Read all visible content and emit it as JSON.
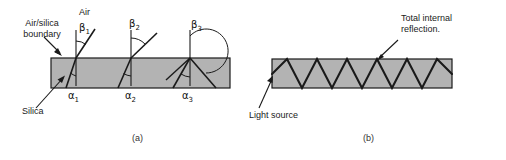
{
  "figure": {
    "title_a": "(a)",
    "title_b": "(b)",
    "bar_fill": "#b3b3b3",
    "bar_stroke": "#1a1a1a",
    "ray_color": "#1a1a1a",
    "text_color": "#1a1a1a"
  },
  "panel_a": {
    "labels": {
      "air": "Air",
      "air_silica_boundary_line1": "Air/silica",
      "air_silica_boundary_line2": "boundary",
      "silica": "Silica",
      "beta1": "β",
      "beta1_sub": "1",
      "beta2": "β",
      "beta2_sub": "2",
      "beta3": "β",
      "beta3_sub": "3",
      "alpha1": "α",
      "alpha1_sub": "1",
      "alpha2": "α",
      "alpha2_sub": "2",
      "alpha3": "α",
      "alpha3_sub": "3"
    },
    "caption": "(a)",
    "slab": {
      "x": 51,
      "y": 58,
      "width": 179,
      "height": 30
    }
  },
  "panel_b": {
    "labels": {
      "total_internal_reflection_line1": "Total internal",
      "total_internal_reflection_line2": "reflection.",
      "light_source": "Light source"
    },
    "caption": "(b)",
    "slab": {
      "x": 272,
      "y": 59,
      "width": 180,
      "height": 29
    }
  }
}
